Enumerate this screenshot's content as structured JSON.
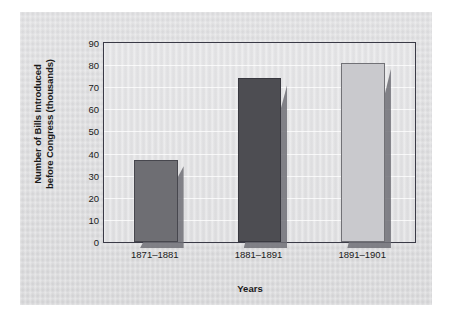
{
  "chart_data": {
    "type": "bar",
    "title": "",
    "categories": [
      "1871–1881",
      "1881–1891",
      "1891–1901"
    ],
    "values": [
      37,
      74,
      81
    ],
    "xlabel": "Years",
    "ylabel": "Number of Bills Introduced before Congress (thousands)",
    "ylabel_lines": [
      "Number of Bills Introduced",
      "before Congress (thousands)"
    ],
    "ylim": [
      0,
      90
    ],
    "ytick_labels": [
      "0",
      "10",
      "20",
      "30",
      "40",
      "50",
      "60",
      "70",
      "80",
      "90"
    ],
    "ytick_values": [
      0,
      10,
      20,
      30,
      40,
      50,
      60,
      70,
      80,
      90
    ],
    "grid": true,
    "legend": "none",
    "bar_colors": [
      "#6e6e73",
      "#4d4d52",
      "#c9c9cd"
    ],
    "plot_border_color": "#3a3a46",
    "plot_background_color": "#e0e0e2",
    "figure_background_color": "#d8d8da",
    "shadow_color": "#6f6f76"
  }
}
